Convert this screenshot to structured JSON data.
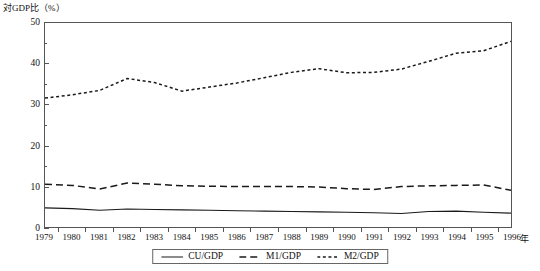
{
  "chart_data": {
    "type": "line",
    "title": "対GDP比（%）",
    "xlabel": "年",
    "ylabel": "",
    "x": [
      1979,
      1980,
      1981,
      1982,
      1983,
      1984,
      1985,
      1986,
      1987,
      1988,
      1989,
      1990,
      1991,
      1992,
      1993,
      1994,
      1995,
      1996
    ],
    "categories": [
      "1979",
      "1980",
      "1981",
      "1982",
      "1983",
      "1984",
      "1985",
      "1986",
      "1987",
      "1988",
      "1989",
      "1990",
      "1991",
      "1992",
      "1993",
      "1994",
      "1995",
      "1996"
    ],
    "xlim": [
      1979,
      1996
    ],
    "ylim": [
      0,
      50
    ],
    "yticks": [
      0,
      10,
      20,
      30,
      40,
      50
    ],
    "yticks_minor": [
      5,
      15,
      25,
      35,
      45
    ],
    "grid": false,
    "legend_position": "bottom-center",
    "series": [
      {
        "name": "CU/GDP",
        "style": "solid",
        "values": [
          4.7,
          4.5,
          4.1,
          4.4,
          4.3,
          4.2,
          4.1,
          4.0,
          3.9,
          3.8,
          3.7,
          3.6,
          3.5,
          3.3,
          3.8,
          3.9,
          3.6,
          3.4
        ]
      },
      {
        "name": "M1/GDP",
        "style": "dashed",
        "values": [
          10.5,
          10.2,
          9.3,
          10.8,
          10.5,
          10.1,
          10.0,
          9.9,
          9.9,
          9.9,
          9.8,
          9.4,
          9.2,
          9.9,
          10.1,
          10.2,
          10.3,
          9.0
        ]
      },
      {
        "name": "M2/GDP",
        "style": "dotted",
        "values": [
          31.6,
          32.4,
          33.5,
          36.4,
          35.4,
          33.3,
          34.3,
          35.3,
          36.6,
          37.9,
          38.8,
          37.8,
          37.9,
          38.7,
          40.6,
          42.6,
          43.2,
          45.5
        ]
      }
    ]
  },
  "legend": {
    "items": [
      {
        "label": "CU/GDP",
        "style": "solid"
      },
      {
        "label": "M1/GDP",
        "style": "dashed"
      },
      {
        "label": "M2/GDP",
        "style": "dotted"
      }
    ]
  },
  "colors": {
    "axis": "#555555",
    "line": "#1a1a1a",
    "background": "#ffffff"
  }
}
